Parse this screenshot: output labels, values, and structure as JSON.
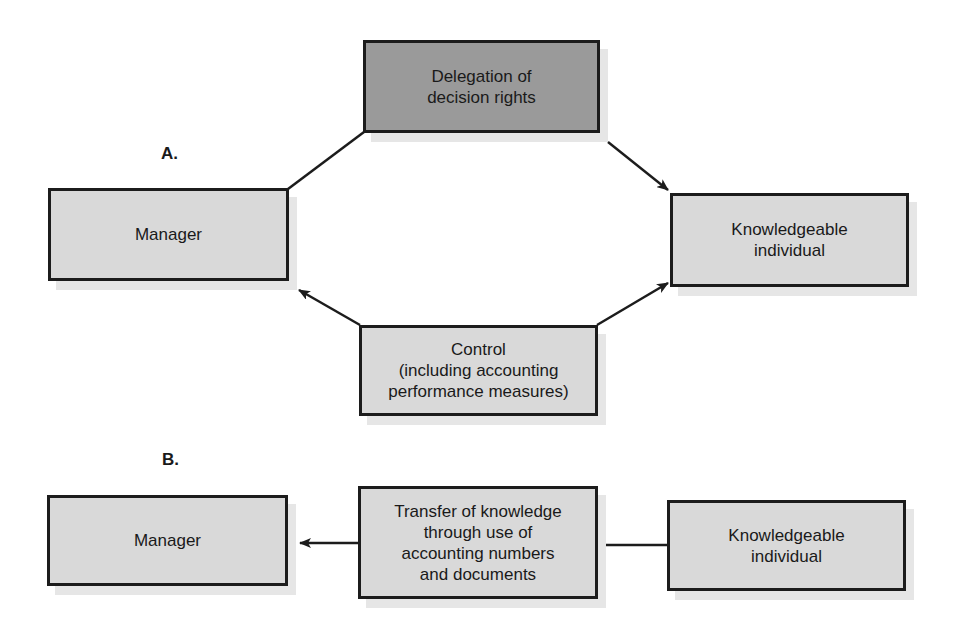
{
  "diagram": {
    "section_a": {
      "label": "A.",
      "boxes": {
        "delegation": "Delegation of\ndecision rights",
        "manager": "Manager",
        "knowledgeable": "Knowledgeable\nindividual",
        "control": "Control\n(including accounting\nperformance measures)"
      },
      "edges": [
        {
          "from": "manager",
          "via": "delegation",
          "to": "knowledgeable",
          "arrow": "to knowledgeable"
        },
        {
          "from": "control",
          "to": "manager",
          "arrow": "to manager"
        },
        {
          "from": "control",
          "to": "knowledgeable",
          "arrow": "to knowledgeable"
        }
      ]
    },
    "section_b": {
      "label": "B.",
      "boxes": {
        "manager": "Manager",
        "transfer": "Transfer of knowledge\nthrough use of\naccounting numbers\nand documents",
        "knowledgeable": "Knowledgeable\nindividual"
      },
      "edges": [
        {
          "from": "knowledgeable",
          "via": "transfer",
          "to": "manager",
          "arrow": "to manager"
        }
      ]
    },
    "colors": {
      "box_fill": "#d9d9d9",
      "highlight_fill": "#9a9a9a",
      "border": "#1c1c1c",
      "shadow": "#e6e6e6"
    }
  }
}
